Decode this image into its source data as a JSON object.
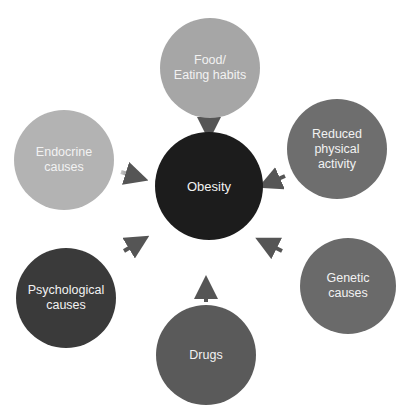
{
  "diagram": {
    "type": "hub-and-spoke",
    "center": {
      "label": "Obesity",
      "color": "#1c1c1c"
    },
    "causes": [
      {
        "label": "Food/\nEating habits",
        "color": "#a6a6a6",
        "position": "top"
      },
      {
        "label": "Reduced\nphysical\nactivity",
        "color": "#6e6e6e",
        "position": "upper-right"
      },
      {
        "label": "Genetic\ncauses",
        "color": "#6a6a6a",
        "position": "lower-right"
      },
      {
        "label": "Drugs",
        "color": "#5a5a5a",
        "position": "bottom"
      },
      {
        "label": "Psychological\ncauses",
        "color": "#3a3a3a",
        "position": "lower-left"
      },
      {
        "label": "Endocrine\ncauses",
        "color": "#b3b3b3",
        "position": "upper-left"
      }
    ],
    "arrow_color": "#555555"
  }
}
